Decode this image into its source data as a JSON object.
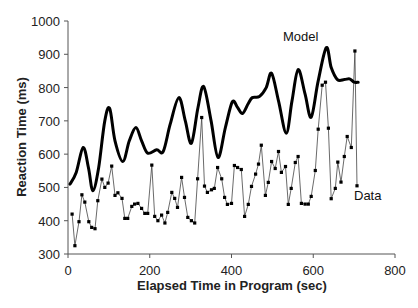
{
  "chart_data": {
    "type": "line",
    "title": "",
    "xlabel": "Elapsed Time in Program (sec)",
    "ylabel": "Reaction Time (ms)",
    "xlim": [
      0,
      800
    ],
    "ylim": [
      300,
      1000
    ],
    "xticks": [
      0,
      200,
      400,
      600,
      800
    ],
    "yticks": [
      300,
      400,
      500,
      600,
      700,
      800,
      900,
      1000
    ],
    "grid": false,
    "legend": "inline labels",
    "series": [
      {
        "name": "Model",
        "style": "thick smooth line",
        "color": "#000000",
        "label_pos": {
          "x": 283,
          "y": 41
        },
        "x": [
          5,
          20,
          37,
          50,
          61,
          75,
          90,
          102,
          115,
          134,
          150,
          166,
          180,
          195,
          217,
          233,
          250,
          271,
          287,
          302,
          318,
          332,
          350,
          367,
          385,
          402,
          415,
          427,
          441,
          451,
          468,
          485,
          498,
          515,
          534,
          548,
          563,
          580,
          595,
          612,
          632,
          644,
          659,
          676,
          689,
          700,
          710
        ],
        "values": [
          510,
          545,
          620,
          560,
          490,
          560,
          700,
          737,
          640,
          578,
          640,
          680,
          640,
          603,
          613,
          608,
          690,
          770,
          700,
          633,
          740,
          803,
          700,
          590,
          680,
          757,
          740,
          722,
          752,
          770,
          773,
          800,
          843,
          760,
          663,
          760,
          854,
          780,
          711,
          820,
          920,
          860,
          824,
          824,
          826,
          816,
          816
        ]
      },
      {
        "name": "Data",
        "style": "thin line with square markers",
        "color": "#000000",
        "label_pos": {
          "x": 354,
          "y": 200
        },
        "x": [
          10,
          17,
          27,
          34,
          41,
          51,
          58,
          66,
          73,
          83,
          90,
          98,
          107,
          115,
          122,
          132,
          139,
          146,
          156,
          163,
          171,
          180,
          188,
          195,
          205,
          212,
          220,
          229,
          237,
          244,
          254,
          261,
          268,
          278,
          285,
          293,
          302,
          310,
          317,
          327,
          334,
          341,
          351,
          358,
          366,
          376,
          383,
          390,
          400,
          407,
          415,
          424,
          432,
          441,
          449,
          459,
          466,
          473,
          483,
          490,
          498,
          507,
          515,
          522,
          532,
          539,
          546,
          556,
          563,
          571,
          580,
          588,
          595,
          605,
          612,
          622,
          630,
          637,
          644,
          654,
          660,
          668,
          676,
          683,
          693,
          702,
          707
        ],
        "values": [
          420,
          325,
          397,
          478,
          456,
          397,
          380,
          376,
          460,
          525,
          500,
          513,
          564,
          476,
          484,
          467,
          407,
          407,
          443,
          450,
          452,
          437,
          422,
          422,
          567,
          413,
          400,
          417,
          393,
          425,
          485,
          467,
          440,
          530,
          470,
          410,
          400,
          393,
          526,
          710,
          504,
          485,
          493,
          497,
          560,
          526,
          470,
          449,
          452,
          566,
          560,
          554,
          413,
          449,
          503,
          540,
          570,
          627,
          476,
          515,
          578,
          557,
          608,
          545,
          563,
          449,
          497,
          575,
          593,
          452,
          450,
          450,
          473,
          551,
          675,
          807,
          816,
          678,
          466,
          497,
          576,
          516,
          593,
          653,
          620,
          910,
          505
        ]
      }
    ]
  },
  "labels": {
    "xlabel": "Elapsed Time in Program (sec)",
    "ylabel": "Reaction Time (ms)",
    "model": "Model",
    "data": "Data",
    "xticks": [
      "0",
      "200",
      "400",
      "600",
      "800"
    ],
    "yticks": [
      "300",
      "400",
      "500",
      "600",
      "700",
      "800",
      "900",
      "1000"
    ]
  }
}
